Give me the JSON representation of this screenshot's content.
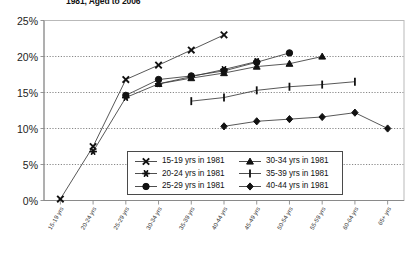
{
  "chart_title": "1981, Aged to 2006",
  "legend": {
    "left_column": [
      {
        "label": "15-19 yrs in 1981",
        "marker": "cross-x-marker"
      },
      {
        "label": "20-24 yrs in 1981",
        "marker": "asterisk-marker"
      },
      {
        "label": "25-29 yrs in 1981",
        "marker": "circle-marker"
      }
    ],
    "right_column": [
      {
        "label": "30-34 yrs in 1981",
        "marker": "triangle-marker"
      },
      {
        "label": "35-39 yrs in 1981",
        "marker": "vertical-bar-marker"
      },
      {
        "label": "40-44 yrs in 1981",
        "marker": "diamond-marker"
      }
    ]
  },
  "chart_data": {
    "type": "line",
    "title": "1981, Aged to 2006",
    "xlabel": "",
    "ylabel": "",
    "ylim": [
      0,
      25
    ],
    "yticks": [
      0,
      5,
      10,
      15,
      20,
      25
    ],
    "ytick_labels": [
      "0%",
      "5%",
      "10%",
      "15%",
      "20%",
      "25%"
    ],
    "grid": true,
    "legend_position": "inside-bottom-center",
    "categories": [
      "15-19 yrs",
      "20-24 yrs",
      "25-29 yrs",
      "30-34 yrs",
      "35-39 yrs",
      "40-44 yrs",
      "45-49 yrs",
      "50-54 yrs",
      "55-59 yrs",
      "60-64 yrs",
      "65+ yrs"
    ],
    "series": [
      {
        "name": "15-19 yrs in 1981",
        "marker": "cross-x-marker",
        "x": [
          "15-19 yrs",
          "20-24 yrs",
          "25-29 yrs",
          "30-34 yrs",
          "35-39 yrs",
          "40-44 yrs"
        ],
        "values": [
          0.2,
          7.5,
          16.8,
          18.8,
          20.9,
          23.0
        ]
      },
      {
        "name": "20-24 yrs in 1981",
        "marker": "asterisk-marker",
        "x": [
          "20-24 yrs",
          "25-29 yrs",
          "30-34 yrs",
          "35-39 yrs",
          "40-44 yrs",
          "45-49 yrs"
        ],
        "values": [
          6.8,
          14.3,
          16.2,
          17.2,
          18.2,
          19.3
        ]
      },
      {
        "name": "25-29 yrs in 1981",
        "marker": "circle-marker",
        "x": [
          "25-29 yrs",
          "30-34 yrs",
          "35-39 yrs",
          "40-44 yrs",
          "45-49 yrs",
          "50-54 yrs"
        ],
        "values": [
          14.6,
          16.8,
          17.3,
          18.0,
          19.2,
          20.5
        ]
      },
      {
        "name": "30-34 yrs in 1981",
        "marker": "triangle-marker",
        "x": [
          "30-34 yrs",
          "35-39 yrs",
          "40-44 yrs",
          "45-49 yrs",
          "50-54 yrs",
          "55-59 yrs"
        ],
        "values": [
          16.2,
          17.0,
          17.7,
          18.6,
          19.0,
          20.0
        ]
      },
      {
        "name": "35-39 yrs in 1981",
        "marker": "vertical-bar-marker",
        "x": [
          "35-39 yrs",
          "40-44 yrs",
          "45-49 yrs",
          "50-54 yrs",
          "55-59 yrs",
          "60-64 yrs"
        ],
        "values": [
          13.8,
          14.3,
          15.3,
          15.8,
          16.1,
          16.5
        ]
      },
      {
        "name": "40-44 yrs in 1981",
        "marker": "diamond-marker",
        "x": [
          "40-44 yrs",
          "45-49 yrs",
          "50-54 yrs",
          "55-59 yrs",
          "60-64 yrs",
          "65+ yrs"
        ],
        "values": [
          10.3,
          11.0,
          11.3,
          11.6,
          12.2,
          10.0
        ]
      }
    ]
  }
}
